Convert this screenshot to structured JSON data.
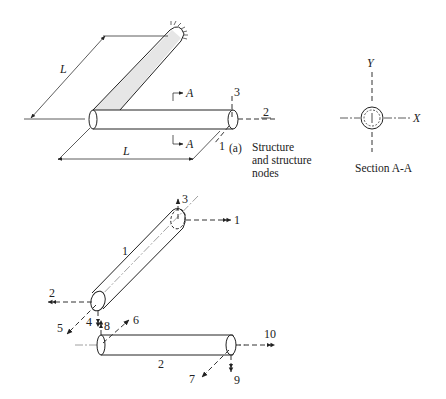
{
  "figure": {
    "part_a": {
      "dimension_labels": [
        "L",
        "L"
      ],
      "section_marker": "A",
      "node_axis_labels": {
        "axis_1": "1",
        "axis_2": "2",
        "axis_3": "3"
      },
      "caption_tag": "(a)",
      "caption_lines": [
        "Structure",
        "and structure",
        "nodes"
      ]
    },
    "section": {
      "axis_x": "X",
      "axis_y": "Y",
      "caption": "Section A-A"
    },
    "part_b": {
      "element_labels": [
        "1",
        "2"
      ],
      "dof_labels": [
        "1",
        "2",
        "3",
        "4",
        "5",
        "6",
        "7",
        "8",
        "9",
        "10"
      ]
    }
  }
}
